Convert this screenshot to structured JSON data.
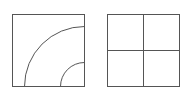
{
  "figures": [
    {
      "name": "square-with-quarter-arcs",
      "square": {
        "x": 12.5,
        "y": 14.5,
        "size": 72
      },
      "arcs": [
        {
          "radius": 60
        },
        {
          "radius": 24
        }
      ]
    },
    {
      "name": "square-divided-into-four",
      "square": {
        "x": 107.5,
        "y": 14.5,
        "size": 72
      },
      "divisions": 2
    }
  ],
  "colors": {
    "stroke": "#555555",
    "background": "#ffffff"
  }
}
